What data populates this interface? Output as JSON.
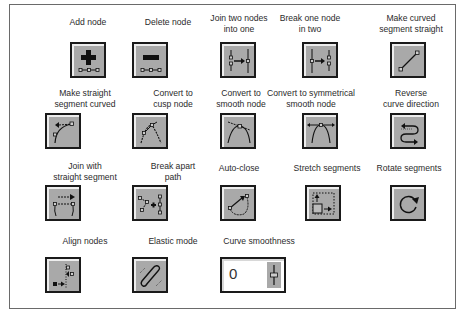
{
  "tools": [
    {
      "id": "add-node",
      "label": "Add node",
      "icon": "add-node-icon"
    },
    {
      "id": "delete-node",
      "label": "Delete node",
      "icon": "delete-node-icon"
    },
    {
      "id": "join-nodes",
      "label": "Join two nodes into one",
      "label_lines": [
        "Join two nodes",
        "into one"
      ],
      "icon": "join-nodes-icon"
    },
    {
      "id": "break-node",
      "label": "Break one node in two",
      "label_lines": [
        "Break one node",
        "in two"
      ],
      "icon": "break-node-icon"
    },
    {
      "id": "curve-to-straight",
      "label": "Make curved segment straight",
      "label_lines": [
        "Make curved",
        "segment straight"
      ],
      "icon": "line-icon"
    },
    {
      "id": "straight-to-curve",
      "label": "Make straight segment curved",
      "label_lines": [
        "Make straight",
        "segment curved"
      ],
      "icon": "curve-segment-icon"
    },
    {
      "id": "cusp-node",
      "label": "Convert to cusp node",
      "label_lines": [
        "Convert to",
        "cusp node"
      ],
      "icon": "cusp-node-icon"
    },
    {
      "id": "smooth-node",
      "label": "Convert to smooth node",
      "label_lines": [
        "Convert to",
        "smooth node"
      ],
      "icon": "smooth-node-icon"
    },
    {
      "id": "symmetrical-node",
      "label": "Convert to symmetrical smooth node",
      "label_lines": [
        "Convert to symmetrical",
        "smooth node"
      ],
      "icon": "symmetrical-node-icon"
    },
    {
      "id": "reverse-direction",
      "label": "Reverse curve direction",
      "label_lines": [
        "Reverse",
        "curve direction"
      ],
      "icon": "reverse-direction-icon"
    },
    {
      "id": "join-straight",
      "label": "Join with straight segment",
      "label_lines": [
        "Join with",
        "straight segment"
      ],
      "icon": "join-straight-icon"
    },
    {
      "id": "break-apart",
      "label": "Break apart path",
      "label_lines": [
        "Break apart",
        "path"
      ],
      "icon": "break-apart-icon"
    },
    {
      "id": "auto-close",
      "label": "Auto-close",
      "icon": "auto-close-icon"
    },
    {
      "id": "stretch-segments",
      "label": "Stretch segments",
      "icon": "stretch-icon"
    },
    {
      "id": "rotate-segments",
      "label": "Rotate segments",
      "icon": "rotate-icon"
    },
    {
      "id": "align-nodes",
      "label": "Align nodes",
      "icon": "align-nodes-icon"
    },
    {
      "id": "elastic-mode",
      "label": "Elastic mode",
      "icon": "elastic-icon"
    }
  ],
  "curve_smoothness": {
    "label": "Curve smoothness",
    "value": "0"
  },
  "colors": {
    "button_face": "#a9a9a9",
    "button_border": "#1a1a1a",
    "highlight": "#ededed",
    "frame": "#6a6a6a"
  }
}
